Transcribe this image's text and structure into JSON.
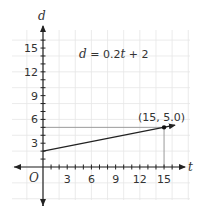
{
  "chart_data": {
    "type": "line",
    "title": "",
    "equation": "d = 0.2t + 2",
    "equation_parts": {
      "lhs": "d",
      "eq": " = 0.2",
      "var": "t",
      "rest": " + 2"
    },
    "xlabel": "t",
    "ylabel": "d",
    "origin_label": "O",
    "xlim": [
      -4,
      18
    ],
    "ylim": [
      -4,
      17
    ],
    "xticks": [
      3,
      6,
      9,
      12,
      15
    ],
    "yticks": [
      3,
      6,
      9,
      12,
      15
    ],
    "xtick_labels": [
      "3",
      "6",
      "9",
      "12",
      "15"
    ],
    "ytick_labels": [
      "3",
      "6",
      "9",
      "12",
      "15"
    ],
    "grid": true,
    "series": [
      {
        "name": "d = 0.2t + 2",
        "x": [
          0,
          15
        ],
        "y": [
          2,
          5
        ],
        "arrow_end": true
      }
    ],
    "point": {
      "x": 15,
      "y": 5.0,
      "label": "(15, 5.0)"
    },
    "guide_lines": [
      {
        "from": [
          0,
          5
        ],
        "to": [
          15,
          5
        ]
      },
      {
        "from": [
          15,
          0
        ],
        "to": [
          15,
          5
        ]
      }
    ]
  }
}
